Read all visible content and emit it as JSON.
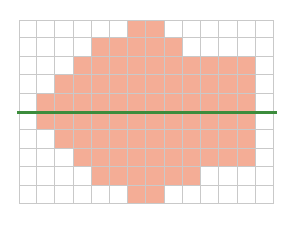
{
  "canvas": {
    "width": 293,
    "height": 228,
    "background": "#ffffff"
  },
  "chart_data": {
    "type": "heatmap",
    "title": "",
    "subtitle": "",
    "xlabel": "",
    "ylabel": "",
    "grid": true,
    "legend": null,
    "legend_position": "none",
    "columns": 14,
    "rows": 10,
    "xlim": [
      0,
      14
    ],
    "ylim": [
      0,
      10
    ],
    "x_tick_labels": [],
    "y_tick_labels": [],
    "cell_fill_color": "#f4ad96",
    "cell_empty_color": "#ffffff",
    "grid_line_color": "#c9c9c9",
    "annotations": [
      {
        "name": "horizontal-reference-line",
        "type": "hline",
        "y": 5,
        "color": "#3c8c3c",
        "width_px": 3,
        "extends_beyond_axes": true,
        "x_start_px": 17,
        "x_end_px": 277
      }
    ],
    "values": [
      [
        0,
        0,
        0,
        0,
        0,
        0,
        1,
        1,
        0,
        0,
        0,
        0,
        0,
        0
      ],
      [
        0,
        0,
        0,
        0,
        1,
        1,
        1,
        1,
        1,
        0,
        0,
        0,
        0,
        0
      ],
      [
        0,
        0,
        0,
        1,
        1,
        1,
        1,
        1,
        1,
        1,
        1,
        1,
        1,
        0
      ],
      [
        0,
        0,
        1,
        1,
        1,
        1,
        1,
        1,
        1,
        1,
        1,
        1,
        1,
        0
      ],
      [
        0,
        1,
        1,
        1,
        1,
        1,
        1,
        1,
        1,
        1,
        1,
        1,
        1,
        0
      ],
      [
        0,
        1,
        1,
        1,
        1,
        1,
        1,
        1,
        1,
        1,
        1,
        1,
        1,
        0
      ],
      [
        0,
        0,
        1,
        1,
        1,
        1,
        1,
        1,
        1,
        1,
        1,
        1,
        1,
        0
      ],
      [
        0,
        0,
        0,
        1,
        1,
        1,
        1,
        1,
        1,
        1,
        1,
        1,
        1,
        0
      ],
      [
        0,
        0,
        0,
        0,
        1,
        1,
        1,
        1,
        1,
        1,
        0,
        0,
        0,
        0
      ],
      [
        0,
        0,
        0,
        0,
        0,
        0,
        1,
        1,
        0,
        0,
        0,
        0,
        0,
        0
      ]
    ]
  }
}
